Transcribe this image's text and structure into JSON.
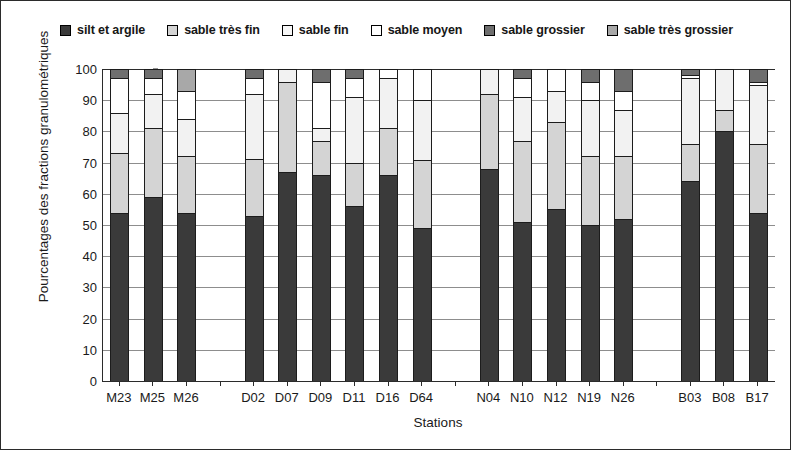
{
  "chart_data": {
    "type": "bar",
    "subtype": "stacked-vertical",
    "title": "",
    "xlabel": "Stations",
    "ylabel": "Pourcentages des fractions granulométriques",
    "ylim": [
      0,
      100
    ],
    "yticks": [
      0,
      10,
      20,
      30,
      40,
      50,
      60,
      70,
      80,
      90,
      100
    ],
    "grid": "horizontal",
    "legend_position": "top-center",
    "categories": [
      "M23",
      "M25",
      "M26",
      "",
      "D02",
      "D07",
      "D09",
      "D11",
      "D16",
      "D64",
      "",
      "N04",
      "N10",
      "N12",
      "N19",
      "N26",
      "",
      "B03",
      "B08",
      "B17"
    ],
    "series": [
      {
        "name": "silt et argile",
        "color": "#3a3a3a",
        "values": [
          54,
          59,
          54,
          null,
          53,
          67,
          66,
          56,
          66,
          49,
          null,
          68,
          51,
          55,
          50,
          52,
          null,
          64,
          80,
          54
        ]
      },
      {
        "name": "sable très fin",
        "color": "#d4d4d4",
        "values": [
          19,
          22,
          18,
          null,
          18,
          29,
          11,
          14,
          15,
          22,
          null,
          24,
          26,
          28,
          22,
          20,
          null,
          12,
          7,
          22
        ]
      },
      {
        "name": "sable fin",
        "color": "#f2f2f2",
        "values": [
          13,
          11,
          12,
          null,
          21,
          4,
          4,
          21,
          16,
          19,
          null,
          8,
          14,
          10,
          18,
          15,
          null,
          21,
          13,
          19
        ]
      },
      {
        "name": "sable moyen",
        "color": "#ffffff",
        "values": [
          11,
          5,
          9,
          null,
          5,
          0,
          15,
          6,
          3,
          10,
          null,
          0,
          6,
          7,
          6,
          6,
          null,
          1,
          0,
          1
        ]
      },
      {
        "name": "sable grossier",
        "color": "#6e6e6e",
        "values": [
          3,
          3,
          0,
          null,
          3,
          0,
          4,
          3,
          0,
          0,
          null,
          0,
          3,
          0,
          4,
          7,
          null,
          2,
          0,
          4
        ]
      },
      {
        "name": "sable très grossier",
        "color": "#a8a8a8",
        "values": [
          0,
          0,
          7,
          null,
          0,
          0,
          0,
          0,
          0,
          0,
          null,
          0,
          0,
          0,
          0,
          0,
          null,
          0,
          0,
          0
        ]
      }
    ]
  },
  "legend": {
    "items": [
      {
        "label": "silt et argile",
        "color": "#3a3a3a"
      },
      {
        "label": "sable très fin",
        "color": "#d4d4d4"
      },
      {
        "label": "sable fin",
        "color": "#f7f7f7"
      },
      {
        "label": "sable moyen",
        "color": "#ffffff"
      },
      {
        "label": "sable grossier",
        "color": "#6e6e6e"
      },
      {
        "label": "sable très grossier",
        "color": "#a8a8a8"
      }
    ]
  },
  "axes": {
    "x_title": "Stations",
    "y_title": "Pourcentages des fractions granulométriques"
  }
}
